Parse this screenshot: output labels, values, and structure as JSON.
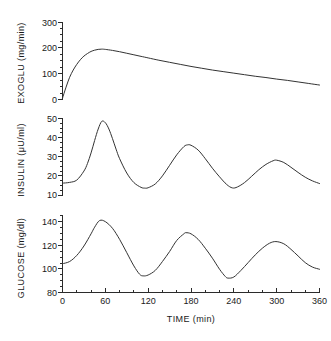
{
  "figure": {
    "background": "#ffffff",
    "line_color": "#333333",
    "axis_color": "#2b2b2b"
  },
  "chart_data": [
    {
      "type": "line",
      "panel": "top",
      "title": "",
      "xlabel": "",
      "ylabel": "EXOGLU  (mg/min)",
      "ylabel_name": "EXOGLU",
      "yunits": "mg/min",
      "xlim": [
        0,
        360
      ],
      "ylim": [
        0,
        300
      ],
      "yticks": [
        0,
        100,
        200,
        300
      ],
      "ytick_labels": [
        "0",
        "100",
        "200",
        "300"
      ],
      "yminor_step": 25,
      "xticks": [
        0,
        60,
        120,
        180,
        240,
        300,
        360
      ],
      "grid": "off",
      "legend": "none",
      "x": [
        0,
        5,
        10,
        15,
        20,
        25,
        30,
        35,
        40,
        45,
        50,
        55,
        60,
        70,
        80,
        90,
        100,
        110,
        120,
        135,
        150,
        165,
        180,
        195,
        210,
        225,
        240,
        255,
        270,
        285,
        300,
        315,
        330,
        345,
        360
      ],
      "values": [
        5,
        48,
        86,
        114,
        136,
        154,
        168,
        178,
        186,
        191,
        194,
        195,
        194,
        190,
        185,
        179,
        173,
        167,
        161,
        152,
        144,
        136,
        128,
        121,
        114,
        108,
        102,
        96,
        90,
        85,
        79,
        74,
        68,
        62,
        56
      ]
    },
    {
      "type": "line",
      "panel": "middle",
      "title": "",
      "xlabel": "",
      "ylabel": "INSULIN  (μU/ml)",
      "ylabel_name": "INSULIN",
      "yunits": "μU/ml",
      "xlim": [
        0,
        360
      ],
      "ylim": [
        10,
        50
      ],
      "yticks": [
        10,
        20,
        30,
        40,
        50
      ],
      "ytick_labels": [
        "10",
        "20",
        "30",
        "40",
        "50"
      ],
      "yminor_step": 2.5,
      "xticks": [
        0,
        60,
        120,
        180,
        240,
        300,
        360
      ],
      "grid": "off",
      "legend": "none",
      "peaks": [
        {
          "t": 55,
          "value": 48.5
        },
        {
          "t": 175,
          "value": 36.2
        },
        {
          "t": 300,
          "value": 28.2
        }
      ],
      "troughs": [
        {
          "t": 115,
          "value": 13.6
        },
        {
          "t": 238,
          "value": 13.7
        }
      ],
      "x": [
        0,
        10,
        20,
        30,
        35,
        40,
        45,
        50,
        55,
        60,
        65,
        70,
        75,
        80,
        90,
        100,
        110,
        115,
        120,
        130,
        140,
        150,
        160,
        170,
        175,
        180,
        190,
        200,
        210,
        220,
        230,
        238,
        245,
        255,
        265,
        275,
        285,
        295,
        300,
        310,
        320,
        330,
        340,
        350,
        360
      ],
      "values": [
        16.2,
        16.6,
        17.8,
        22.5,
        26.5,
        32.0,
        38.5,
        44.5,
        48.5,
        47.8,
        44.5,
        39.5,
        34.0,
        29.0,
        21.5,
        16.5,
        14.0,
        13.6,
        13.8,
        15.8,
        20.0,
        25.5,
        31.0,
        35.3,
        36.2,
        36.0,
        33.5,
        29.0,
        24.0,
        19.5,
        15.5,
        13.7,
        14.2,
        16.5,
        19.8,
        23.2,
        26.0,
        27.9,
        28.2,
        27.0,
        24.5,
        21.8,
        19.3,
        17.4,
        16.0
      ]
    },
    {
      "type": "line",
      "panel": "bottom",
      "title": "",
      "xlabel": "TIME  (min)",
      "ylabel": "GLUCOSE  (mg/dl)",
      "ylabel_name": "GLUCOSE",
      "yunits": "mg/dl",
      "xlim": [
        0,
        360
      ],
      "ylim": [
        80,
        150
      ],
      "yticks": [
        80,
        100,
        120,
        140
      ],
      "ytick_labels": [
        "80",
        "100",
        "120",
        "140"
      ],
      "yminor_step": 5,
      "xticks": [
        0,
        60,
        120,
        180,
        240,
        300,
        360
      ],
      "xtick_labels": [
        "0",
        "60",
        "120",
        "180",
        "240",
        "300",
        "360"
      ],
      "xminor_step": 20,
      "grid": "off",
      "legend": "none",
      "peaks": [
        {
          "t": 52,
          "value": 145
        },
        {
          "t": 173,
          "value": 134
        },
        {
          "t": 299,
          "value": 126
        }
      ],
      "troughs": [
        {
          "t": 113,
          "value": 95
        },
        {
          "t": 232,
          "value": 93
        }
      ],
      "x": [
        0,
        10,
        20,
        30,
        40,
        45,
        52,
        60,
        70,
        80,
        90,
        100,
        108,
        113,
        120,
        130,
        140,
        150,
        160,
        170,
        173,
        180,
        190,
        200,
        210,
        220,
        228,
        232,
        240,
        250,
        260,
        270,
        280,
        290,
        299,
        310,
        320,
        330,
        340,
        350,
        360
      ],
      "values": [
        106,
        108,
        113.5,
        122,
        133,
        139,
        145,
        144,
        138,
        128,
        116,
        104,
        96.5,
        95,
        95.8,
        100,
        108,
        117,
        127,
        133,
        134,
        133,
        128,
        120,
        111,
        101,
        94.5,
        93,
        94,
        100,
        107,
        114,
        120,
        124.5,
        126,
        124,
        119,
        113,
        107,
        103,
        101
      ]
    }
  ],
  "labels": {
    "exoglu_axis": "EXOGLU  (mg/min)",
    "insulin_axis": "INSULIN  (μU/ml)",
    "glucose_axis": "GLUCOSE  (mg/dl)",
    "time_axis": "TIME  (min)"
  },
  "ticks": {
    "exoglu": [
      "300",
      "200",
      "100",
      "0"
    ],
    "insulin": [
      "50",
      "40",
      "30",
      "20",
      "10"
    ],
    "glucose": [
      "140",
      "120",
      "100",
      "80"
    ],
    "time": [
      "0",
      "60",
      "120",
      "180",
      "240",
      "300",
      "360"
    ]
  }
}
